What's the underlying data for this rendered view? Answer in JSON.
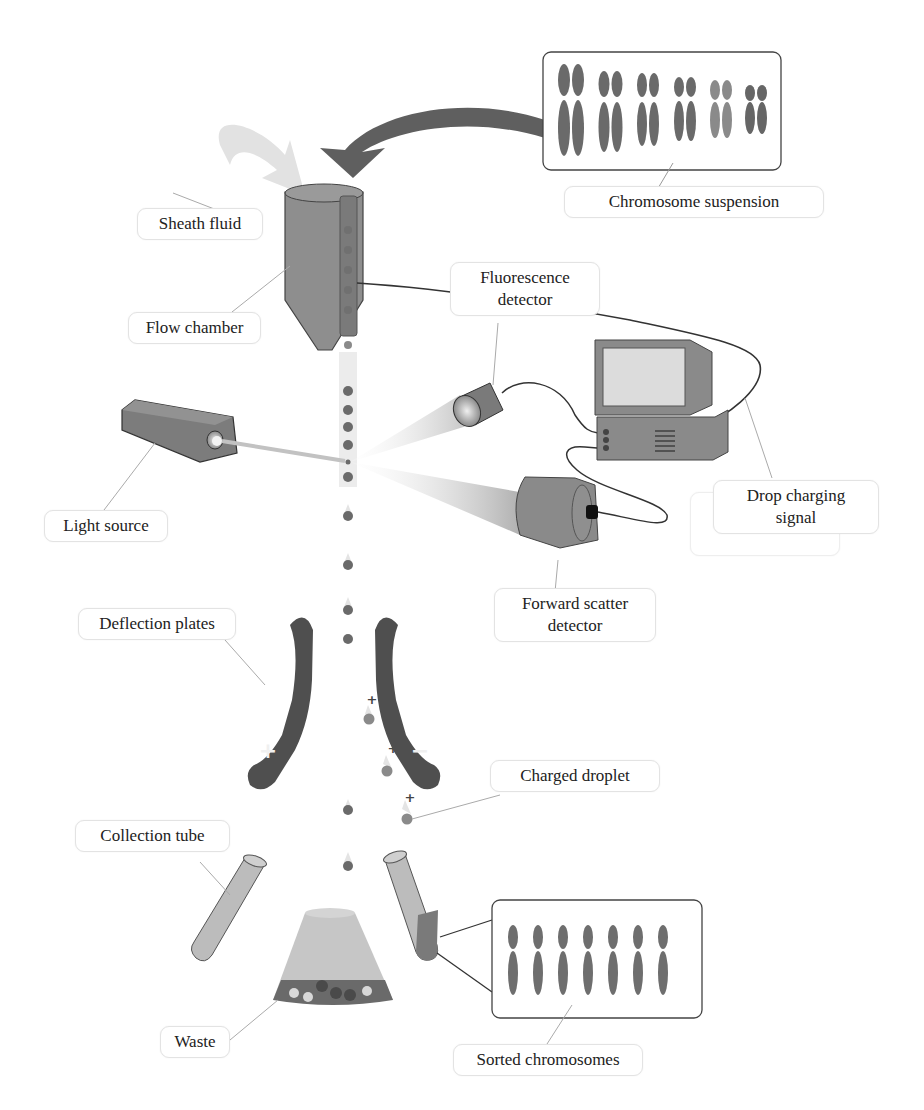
{
  "figure": {
    "top_clipped_text": "...y ... g ..."
  },
  "labels": {
    "chromosome_suspension": "Chromosome suspension",
    "sheath_fluid": "Sheath fluid",
    "flow_chamber": "Flow chamber",
    "fluorescence_detector_line1": "Fluorescence",
    "fluorescence_detector_line2": "detector",
    "light_source": "Light source",
    "drop_charging_signal_line1": "Drop charging",
    "drop_charging_signal_line2": "signal",
    "forward_scatter_detector_line1": "Forward scatter",
    "forward_scatter_detector_line2": "detector",
    "deflection_plates": "Deflection plates",
    "charged_droplet": "Charged droplet",
    "collection_tube": "Collection tube",
    "waste": "Waste",
    "sorted_chromosomes": "Sorted chromosomes"
  },
  "symbols": {
    "plate_left_charge": "+",
    "plate_right_charge": "−",
    "droplet_charge": "+"
  },
  "colors": {
    "dark_gray": "#5f5f5f",
    "mid_gray": "#8a8a8a",
    "light_gray": "#bdbdbd",
    "very_light_gray": "#e2e2e2",
    "chromosome": "#6a6a6a",
    "label_border": "#e3e3e3"
  }
}
